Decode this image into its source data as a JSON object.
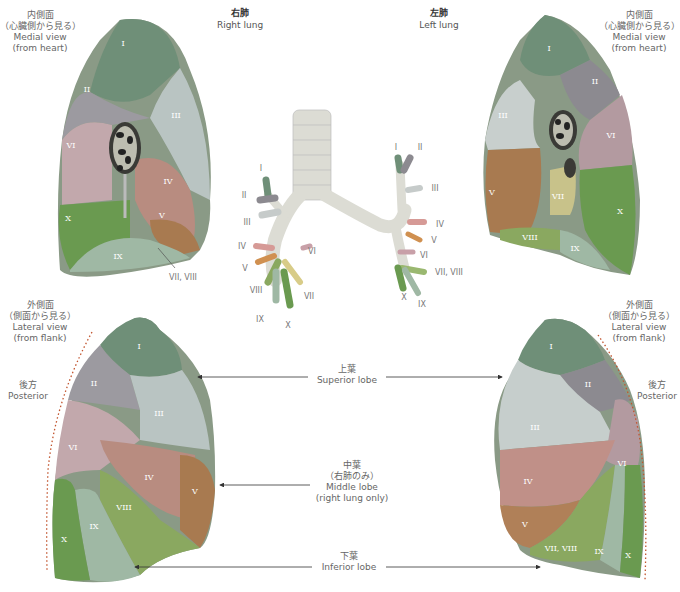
{
  "headings": {
    "right_lung": {
      "jp": "右肺",
      "en": "Right lung"
    },
    "left_lung": {
      "jp": "左肺",
      "en": "Left lung"
    }
  },
  "views": {
    "medial_left": {
      "jp": "内側面",
      "jp2": "（心臓側から見る）",
      "en": "Medial view",
      "en2": "(from heart)"
    },
    "medial_right": {
      "jp": "内側面",
      "jp2": "（心臓側から見る）",
      "en": "Medial view",
      "en2": "(from heart)"
    },
    "lateral_left": {
      "jp": "外側面",
      "jp2": "（側面から見る）",
      "en": "Lateral view",
      "en2": "(from flank)"
    },
    "lateral_right": {
      "jp": "外側面",
      "jp2": "（側面から見る）",
      "en": "Lateral view",
      "en2": "(from flank)"
    }
  },
  "posterior": {
    "left": {
      "jp": "後方",
      "en": "Posterior"
    },
    "right": {
      "jp": "後方",
      "en": "Posterior"
    }
  },
  "lobes": {
    "superior": {
      "jp": "上葉",
      "en": "Superior lobe"
    },
    "middle": {
      "jp": "中葉",
      "jp2": "（右肺のみ）",
      "en": "Middle lobe",
      "en2": "(right lung only)"
    },
    "inferior": {
      "jp": "下葉",
      "en": "Inferior lobe"
    }
  },
  "segment_colors": {
    "I": "#6f8f78",
    "II": "#8c8a90",
    "III": "#b9c4c2",
    "IV": "#b88c80",
    "V": "#a87a50",
    "VI": "#b39aa0",
    "VII": "#c8c28a",
    "VIII": "#8aa860",
    "IX": "#9fb8a4",
    "X": "#6a9a50"
  },
  "right_medial_segments": [
    "I",
    "II",
    "III",
    "VI",
    "IV",
    "V",
    "X",
    "IX"
  ],
  "right_medial_callout": "VII, VIII",
  "left_medial_segments": [
    "I",
    "II",
    "III",
    "VI",
    "V",
    "VII",
    "X",
    "VIII",
    "IX"
  ],
  "right_lateral_segments": [
    "I",
    "II",
    "III",
    "VI",
    "IV",
    "V",
    "VIII",
    "IX",
    "X"
  ],
  "left_lateral_segments": [
    "I",
    "II",
    "III",
    "VI",
    "IV",
    "V",
    "VII, VIII",
    "IX",
    "X"
  ],
  "bronchi_right": [
    "I",
    "II",
    "III",
    "IV",
    "V",
    "VI",
    "VIII",
    "VII",
    "IX",
    "X"
  ],
  "bronchi_left": [
    "I",
    "II",
    "III",
    "IV",
    "V",
    "VI",
    "VII, VIII",
    "X",
    "IX"
  ]
}
